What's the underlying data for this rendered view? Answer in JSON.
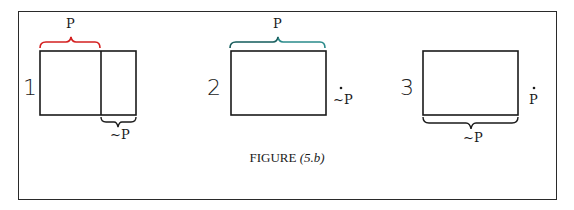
{
  "figure": {
    "caption_main": "FIGURE",
    "caption_num": "(5.b)",
    "panels": [
      {
        "number": "1",
        "top_brace_label": "P",
        "top_brace_color": "#d42020",
        "bottom_brace_label": "~P",
        "description": "Rectangle split into P region (left) and ~P region (right)"
      },
      {
        "number": "2",
        "top_brace_label": "P",
        "top_brace_color": "#2a8a8a",
        "side_label": "~P",
        "side_dot": "•",
        "description": "Rectangle entirely P; ~P is a point outside"
      },
      {
        "number": "3",
        "bottom_brace_label": "~P",
        "side_label": "P",
        "side_dot": "•",
        "description": "Rectangle entirely ~P; P is a point outside"
      }
    ]
  },
  "colors": {
    "frame": "#2a2a2a",
    "ink": "#1a1a1a",
    "brace_red": "#d42020",
    "brace_teal": "#2a8a8a"
  }
}
